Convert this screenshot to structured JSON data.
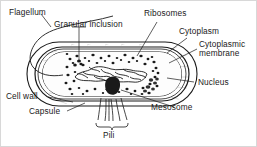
{
  "figure": {
    "background_color": "#ffffff",
    "ink_color": "#1a1a1a",
    "border_color": "#d8d8d8"
  },
  "labels": {
    "flagellum": "Flagellum",
    "granular_inclusion": "Granular inclusion",
    "ribosomes": "Ribosomes",
    "cytoplasm": "Cytoplasm",
    "cytoplasmic_membrane": "Cytoplasmic membrane",
    "nucleus": "Nucleus",
    "mesosome": "Mesosome",
    "cell_wall": "Cell wall",
    "capsule": "Capsule",
    "pili": "Pili"
  },
  "structures": [
    "capsule",
    "cell-wall",
    "cytoplasmic-membrane",
    "cytoplasm",
    "ribosomes",
    "nucleus",
    "mesosome",
    "granular-inclusion",
    "flagellum",
    "pili"
  ]
}
